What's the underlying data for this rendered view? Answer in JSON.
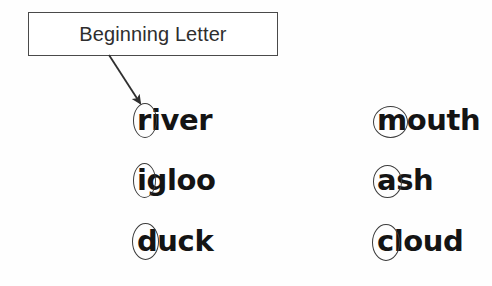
{
  "worksheet": {
    "background_color": "#fefefe",
    "ink_color": "#141414",
    "annotation_color": "#3b3b3b"
  },
  "callout": {
    "label": "Beginning Letter",
    "border_color": "#4a4a4a",
    "arrow": {
      "name": "pointer-arrow",
      "from_x": 110,
      "from_y": 56,
      "to_x": 142,
      "to_y": 106
    }
  },
  "columns": [
    {
      "name": "left-column",
      "words": [
        {
          "text": "river",
          "beginning_letter": "r",
          "ring_width": 22,
          "ring_height": 33,
          "ring_dx": -4,
          "ring_dy": -3
        },
        {
          "text": "igloo",
          "beginning_letter": "i",
          "ring_width": 21,
          "ring_height": 33,
          "ring_dx": -4,
          "ring_dy": -3
        },
        {
          "text": "duck",
          "beginning_letter": "d",
          "ring_width": 25,
          "ring_height": 35,
          "ring_dx": -5,
          "ring_dy": -4
        }
      ]
    },
    {
      "name": "right-column",
      "words": [
        {
          "text": "mouth",
          "beginning_letter": "m",
          "ring_width": 33,
          "ring_height": 30,
          "ring_dx": -4,
          "ring_dy": 0
        },
        {
          "text": "ash",
          "beginning_letter": "a",
          "ring_width": 27,
          "ring_height": 31,
          "ring_dx": -4,
          "ring_dy": -1
        },
        {
          "text": "cloud",
          "beginning_letter": "c",
          "ring_width": 26,
          "ring_height": 35,
          "ring_dx": -5,
          "ring_dy": -3
        }
      ]
    }
  ]
}
